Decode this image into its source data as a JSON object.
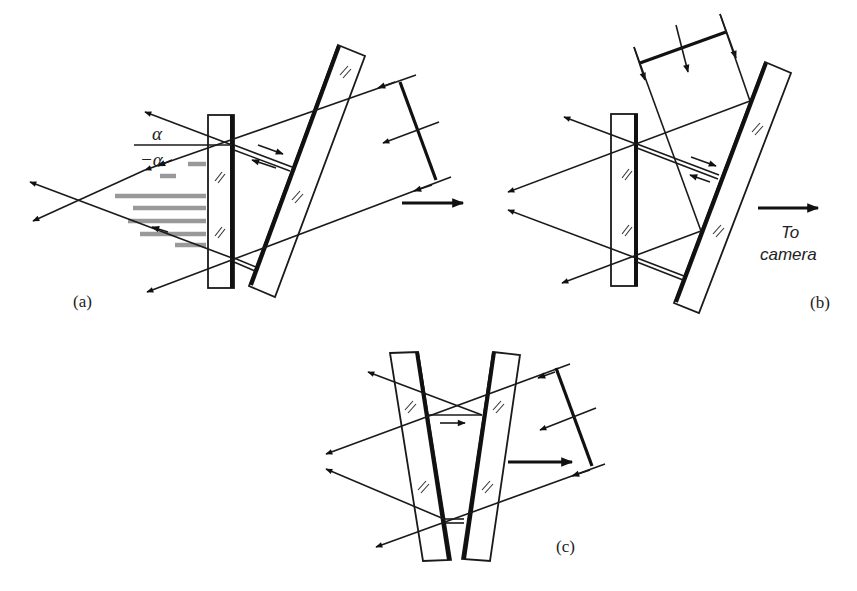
{
  "figure": {
    "panels": [
      {
        "id": "a",
        "label": "(a)",
        "annotations": {
          "alpha_upper": "α",
          "alpha_lower": "−α"
        }
      },
      {
        "id": "b",
        "label": "(b)",
        "annotations": {
          "camera_line1": "To",
          "camera_line2": "camera"
        }
      },
      {
        "id": "c",
        "label": "(c)"
      }
    ]
  },
  "colors": {
    "ink": "#1a1a1a",
    "background": "#ffffff",
    "fringe_shade": "#999999"
  }
}
